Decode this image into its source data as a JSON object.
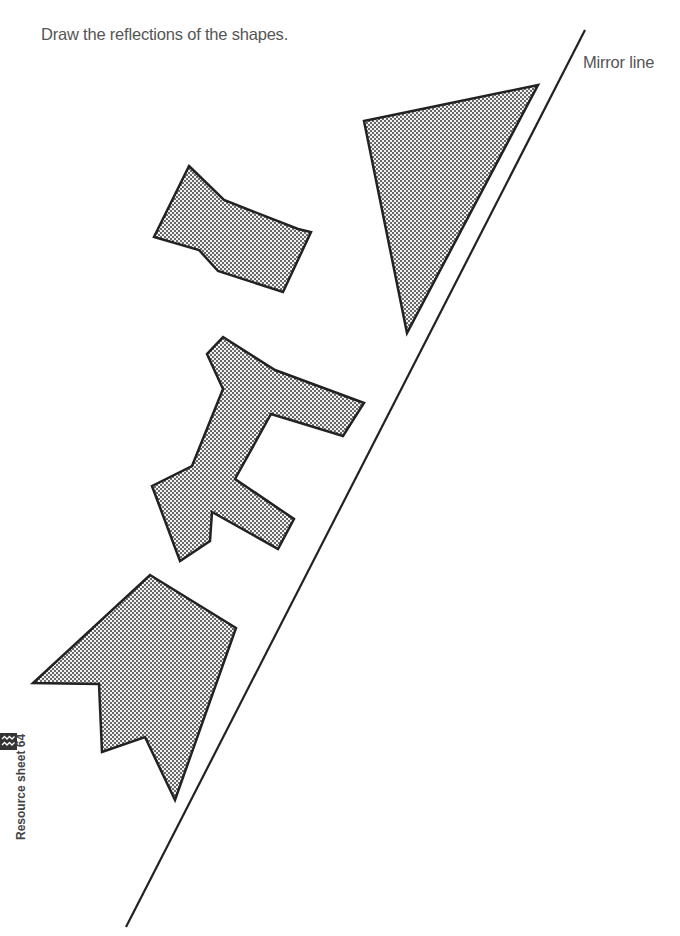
{
  "worksheet": {
    "instruction": "Draw the reflections of the shapes.",
    "mirror_label": "Mirror line",
    "resource_label": "Resource sheet 64",
    "resource_icon": "waves-icon"
  },
  "colors": {
    "outline": "#222222",
    "dot": "#3a3a3a",
    "text": "#555555"
  },
  "mirror_line": {
    "x1": 585,
    "y1": 30,
    "x2": 126,
    "y2": 927
  },
  "shapes": [
    {
      "name": "triangle",
      "points": "364,121 538,85 407,333"
    },
    {
      "name": "bowtie",
      "points": "189,166 224,200 298,229 311,232 283,292 218,271 199,250 154,237"
    },
    {
      "name": "branch-shape",
      "points": "223,337 275,370 364,403 343,436 271,414 235,479 294,519 278,549 212,512 210,541 180,561 152,486 192,466 223,389 207,354"
    },
    {
      "name": "arrow-shape",
      "points": "150,575 236,628 175,800 145,737 102,752 99,684 33,683"
    }
  ]
}
